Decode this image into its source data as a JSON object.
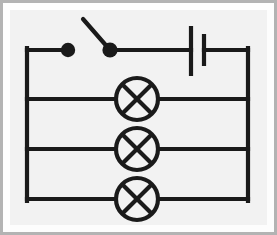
{
  "image": {
    "kind": "circuit-diagram",
    "title": "Parallel circuit with switch, cell and three lamps",
    "canvas_width": 277,
    "canvas_height": 235
  },
  "colors": {
    "outer_mat": "#b3b3b3",
    "white_border": "#fdfdfd",
    "canvas_background": "#f2f2f2",
    "wire": "#1a1a1a",
    "component_fill": "#f2f2f2"
  },
  "style": {
    "wire_stroke_width": 4.2,
    "component_stroke_width": 4.2,
    "lamp_radius": 21,
    "switch_dot_radius": 7.2
  },
  "circuit": {
    "bounds": {
      "left": 27,
      "right": 248,
      "top": 50,
      "bottom": 199
    },
    "rails": [
      {
        "name": "top-rail",
        "y": 50
      },
      {
        "name": "branch-rail-1",
        "y": 99
      },
      {
        "name": "branch-rail-2",
        "y": 149
      },
      {
        "name": "bottom-rail",
        "y": 199
      }
    ],
    "components": [
      {
        "type": "switch",
        "name": "open-switch",
        "state": "open",
        "left_contact": {
          "x": 68,
          "y": 50
        },
        "right_contact": {
          "x": 110,
          "y": 50
        },
        "lever_tip": {
          "x": 83,
          "y": 19
        }
      },
      {
        "type": "cell",
        "name": "battery-cell",
        "long_plate": {
          "x": 191,
          "y_top": 26,
          "y_bottom": 76
        },
        "short_plate": {
          "x": 204,
          "y_top": 34,
          "y_bottom": 66
        }
      },
      {
        "type": "lamp",
        "name": "lamp-1",
        "center": {
          "x": 137,
          "y": 99
        },
        "radius": 21
      },
      {
        "type": "lamp",
        "name": "lamp-2",
        "center": {
          "x": 137,
          "y": 149
        },
        "radius": 21
      },
      {
        "type": "lamp",
        "name": "lamp-3",
        "center": {
          "x": 137,
          "y": 199
        },
        "radius": 21
      }
    ]
  }
}
